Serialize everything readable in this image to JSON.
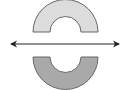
{
  "diagram": {
    "type": "reflection",
    "colors": {
      "background": "#ffffff",
      "original_fill": "#dcdcdc",
      "image_fill": "#a9a9a9",
      "stroke": "#666666",
      "line": "#222222"
    },
    "original_shape": {
      "name": "upper half-annulus",
      "cx": 65.5,
      "base_y": 32,
      "outer_r": 32.5,
      "inner_r": 15.5
    },
    "image_shape": {
      "name": "lower half-annulus",
      "cx": 65.5,
      "base_y": 57,
      "outer_r": 32.5,
      "inner_r": 15.5
    },
    "line_of_reflection": {
      "x1": 10,
      "x2": 120,
      "y": 44,
      "arrows": "both"
    }
  }
}
